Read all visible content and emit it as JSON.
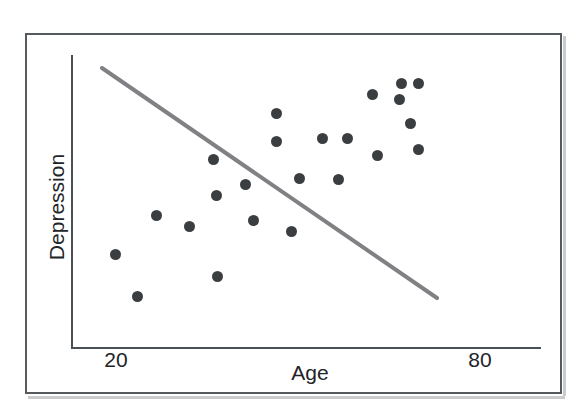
{
  "figure": {
    "axis_titles": {
      "x": "Age",
      "y": "Depression"
    },
    "x_ticks": [
      "20",
      "80"
    ],
    "colors": {
      "point": "#3b3e41",
      "trendline": "#808184",
      "axis": "#4a4f53",
      "frame": "#555a5e",
      "background": "#ffffff"
    }
  },
  "chart_data": {
    "type": "scatter",
    "title": "",
    "xlabel": "Age",
    "ylabel": "Depression",
    "xlim": [
      14,
      86
    ],
    "ylim": [
      0,
      100
    ],
    "grid": false,
    "legend": null,
    "xticks": [
      20,
      80
    ],
    "xticklabels": [
      "20",
      "80"
    ],
    "yticks": [],
    "yticklabels": [],
    "points": [
      {
        "x": 20.2,
        "y": 32.0,
        "px": 115,
        "py": 254
      },
      {
        "x": 23.2,
        "y": 17.6,
        "px": 137,
        "py": 296
      },
      {
        "x": 25.9,
        "y": 45.3,
        "px": 156,
        "py": 215
      },
      {
        "x": 31.1,
        "y": 64.0,
        "px": 213,
        "py": 159
      },
      {
        "x": 31.4,
        "y": 51.7,
        "px": 216,
        "py": 195
      },
      {
        "x": 30.3,
        "y": 40.9,
        "px": 189,
        "py": 226
      },
      {
        "x": 31.6,
        "y": 24.9,
        "px": 217,
        "py": 276
      },
      {
        "x": 37.0,
        "y": 44.1,
        "px": 245,
        "py": 184
      },
      {
        "x": 38.1,
        "y": 32.0,
        "px": 253,
        "py": 220
      },
      {
        "x": 41.3,
        "y": 78.7,
        "px": 276,
        "py": 113
      },
      {
        "x": 41.3,
        "y": 69.1,
        "px": 276,
        "py": 141
      },
      {
        "x": 43.3,
        "y": 28.2,
        "px": 291,
        "py": 231
      },
      {
        "x": 44.3,
        "y": 46.4,
        "px": 299,
        "py": 178
      },
      {
        "x": 47.3,
        "y": 70.1,
        "px": 322,
        "py": 138
      },
      {
        "x": 50.5,
        "y": 70.1,
        "px": 347,
        "py": 138
      },
      {
        "x": 49.2,
        "y": 46.1,
        "px": 338,
        "py": 179
      },
      {
        "x": 54.0,
        "y": 62.1,
        "px": 377,
        "py": 155
      },
      {
        "x": 53.4,
        "y": 81.9,
        "px": 372,
        "py": 94
      },
      {
        "x": 57.1,
        "y": 84.8,
        "px": 399,
        "py": 99
      },
      {
        "x": 57.3,
        "y": 90.1,
        "px": 401,
        "py": 83
      },
      {
        "x": 59.5,
        "y": 90.1,
        "px": 418,
        "py": 83
      },
      {
        "x": 58.3,
        "y": 76.4,
        "px": 410,
        "py": 123
      },
      {
        "x": 59.5,
        "y": 67.4,
        "px": 418,
        "py": 149
      }
    ],
    "trendline": {
      "label": "regression line",
      "x_start": 22.2,
      "y_start": 95.1,
      "x_end": 72.0,
      "y_end": 17.0,
      "px_start": 102,
      "py_start": 68,
      "px_end": 437,
      "py_end": 298,
      "color": "#808184",
      "width": 4,
      "slope_sign": "negative"
    }
  }
}
